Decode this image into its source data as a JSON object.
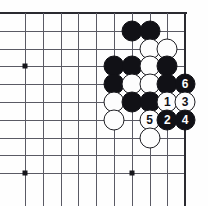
{
  "diagram": {
    "board": {
      "type": "go-board-corner",
      "visible_columns": 10,
      "visible_rows": 10,
      "origin_x": 25,
      "origin_y": 13,
      "spacing_x": 17.8,
      "spacing_y": 17.8,
      "stone_radius": 10.5,
      "edges": [
        "top",
        "right"
      ],
      "line_color": "#5a5a64",
      "edge_color": "#2a2a30",
      "background_color": "#fefefe",
      "star_points": [
        {
          "col": 0,
          "row": 3
        },
        {
          "col": 0,
          "row": 9
        },
        {
          "col": 6,
          "row": 9
        }
      ]
    },
    "stones": [
      {
        "id": "b-c6r1",
        "color": "black",
        "col": 6,
        "row": 1,
        "label": ""
      },
      {
        "id": "b-c7r1",
        "color": "black",
        "col": 7,
        "row": 1,
        "label": ""
      },
      {
        "id": "w-c7r2",
        "color": "white",
        "col": 7,
        "row": 2,
        "label": ""
      },
      {
        "id": "w-c8r2",
        "color": "white",
        "col": 8,
        "row": 2,
        "label": ""
      },
      {
        "id": "b-c5r3",
        "color": "black",
        "col": 5,
        "row": 3,
        "label": ""
      },
      {
        "id": "b-c6r3",
        "color": "black",
        "col": 6,
        "row": 3,
        "label": ""
      },
      {
        "id": "w-c7r3",
        "color": "white",
        "col": 7,
        "row": 3,
        "label": ""
      },
      {
        "id": "b-c8r3",
        "color": "black",
        "col": 8,
        "row": 3,
        "label": ""
      },
      {
        "id": "b-c5r4",
        "color": "black",
        "col": 5,
        "row": 4,
        "label": ""
      },
      {
        "id": "w-c6r4",
        "color": "white",
        "col": 6,
        "row": 4,
        "label": ""
      },
      {
        "id": "w-c7r4",
        "color": "white",
        "col": 7,
        "row": 4,
        "label": ""
      },
      {
        "id": "b-c8r4",
        "color": "black",
        "col": 8,
        "row": 4,
        "label": ""
      },
      {
        "id": "b-c9r4-move6",
        "color": "black",
        "col": 9,
        "row": 4,
        "label": "6"
      },
      {
        "id": "w-c5r5",
        "color": "white",
        "col": 5,
        "row": 5,
        "label": ""
      },
      {
        "id": "b-c6r5",
        "color": "black",
        "col": 6,
        "row": 5,
        "label": ""
      },
      {
        "id": "b-c7r5",
        "color": "black",
        "col": 7,
        "row": 5,
        "label": ""
      },
      {
        "id": "w-c8r5-move1",
        "color": "white",
        "col": 8,
        "row": 5,
        "label": "1"
      },
      {
        "id": "w-c9r5-move3",
        "color": "white",
        "col": 9,
        "row": 5,
        "label": "3"
      },
      {
        "id": "w-c5r6",
        "color": "white",
        "col": 5,
        "row": 6,
        "label": ""
      },
      {
        "id": "w-c7r6-move5",
        "color": "white",
        "col": 7,
        "row": 6,
        "label": "5"
      },
      {
        "id": "b-c8r6-move2",
        "color": "black",
        "col": 8,
        "row": 6,
        "label": "2"
      },
      {
        "id": "b-c9r6-move4",
        "color": "black",
        "col": 9,
        "row": 6,
        "label": "4"
      },
      {
        "id": "w-c7r7",
        "color": "white",
        "col": 7,
        "row": 7,
        "label": ""
      }
    ],
    "move_sequence": [
      "1",
      "2",
      "3",
      "4",
      "5",
      "6"
    ]
  }
}
